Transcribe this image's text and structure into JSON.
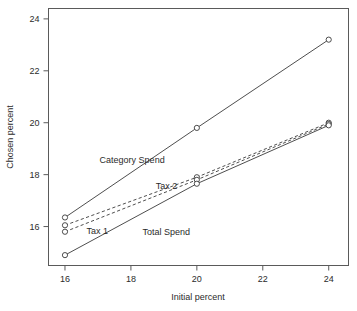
{
  "chart_data": {
    "type": "line",
    "title": "",
    "xlabel": "Initial percent",
    "ylabel": "Chosen percent",
    "xlim": [
      15.5,
      24.6
    ],
    "ylim": [
      14.5,
      24.4
    ],
    "xticks": [
      16,
      18,
      20,
      22,
      24
    ],
    "yticks": [
      16,
      18,
      20,
      22,
      24
    ],
    "xtick_labels": [
      "16",
      "18",
      "20",
      "22",
      "24"
    ],
    "ytick_labels": [
      "16",
      "18",
      "20",
      "22",
      "24"
    ],
    "grid": false,
    "legend": "in-plot text annotations",
    "marker": "open-circle",
    "x": [
      16,
      20,
      24
    ],
    "series": [
      {
        "name": "Category Spend",
        "style": "solid",
        "values": [
          16.35,
          19.8,
          23.2
        ],
        "annotation": "Category Spend"
      },
      {
        "name": "Tax 2",
        "style": "dashed",
        "values": [
          16.05,
          17.9,
          20.0
        ],
        "annotation": "Tax 2"
      },
      {
        "name": "Tax 1",
        "style": "dashed",
        "values": [
          15.8,
          17.8,
          19.95
        ],
        "annotation": "Tax 1"
      },
      {
        "name": "Total Spend",
        "style": "solid",
        "values": [
          14.9,
          17.65,
          19.9
        ],
        "annotation": "Total Spend"
      }
    ],
    "annotations": [
      {
        "text": "Category Spend",
        "x": 17.05,
        "y": 18.45
      },
      {
        "text": "Tax 2",
        "x": 18.75,
        "y": 17.45
      },
      {
        "text": "Tax 1",
        "x": 16.65,
        "y": 15.72
      },
      {
        "text": "Total Spend",
        "x": 18.35,
        "y": 15.68
      }
    ],
    "colors": {
      "line": "#3a3a3a",
      "axis": "#5a5a5a",
      "text": "#2b2b2b",
      "background": "#ffffff"
    }
  }
}
